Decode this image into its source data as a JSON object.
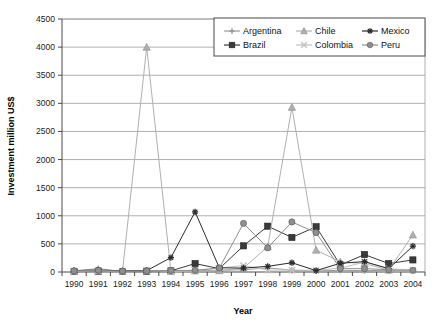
{
  "chart_data": {
    "type": "line",
    "title": "",
    "xlabel": "Year",
    "ylabel": "Investment million US$",
    "categories": [
      "1990",
      "1991",
      "1992",
      "1993",
      "1994",
      "1995",
      "1996",
      "1997",
      "1998",
      "1999",
      "2000",
      "2001",
      "2002",
      "2003",
      "2004"
    ],
    "ylim": [
      0,
      4500
    ],
    "ytick_step": 500,
    "yticks": [
      "0",
      "500",
      "1000",
      "1500",
      "2000",
      "2500",
      "3000",
      "3500",
      "4000",
      "4500"
    ],
    "grid": "horizontal",
    "legend_position": "top-right",
    "legend_columns": 3,
    "series": [
      {
        "name": "Argentina",
        "marker": "plus",
        "color": "#9a9a9a",
        "values": [
          20,
          60,
          10,
          25,
          20,
          25,
          30,
          40,
          75,
          30,
          20,
          30,
          25,
          30,
          35
        ]
      },
      {
        "name": "Brazil",
        "marker": "square",
        "color": "#3a3a3a",
        "values": [
          10,
          15,
          10,
          15,
          20,
          150,
          60,
          465,
          815,
          615,
          805,
          125,
          310,
          150,
          215
        ]
      },
      {
        "name": "Chile",
        "marker": "triangle",
        "color": "#b0b0b0",
        "values": [
          15,
          20,
          15,
          4000,
          15,
          20,
          25,
          70,
          450,
          2930,
          390,
          180,
          150,
          35,
          660
        ]
      },
      {
        "name": "Colombia",
        "marker": "cross",
        "color": "#c0c0c0",
        "values": [
          15,
          25,
          10,
          20,
          15,
          30,
          70,
          115,
          35,
          35,
          30,
          70,
          175,
          60,
          30
        ]
      },
      {
        "name": "Mexico",
        "marker": "star",
        "color": "#2b2b2b",
        "values": [
          25,
          35,
          20,
          25,
          255,
          1070,
          75,
          70,
          100,
          165,
          25,
          155,
          185,
          60,
          460
        ]
      },
      {
        "name": "Peru",
        "marker": "circle",
        "color": "#8f8f8f",
        "values": [
          20,
          30,
          15,
          20,
          25,
          30,
          70,
          865,
          430,
          890,
          700,
          60,
          60,
          40,
          30
        ]
      }
    ]
  }
}
